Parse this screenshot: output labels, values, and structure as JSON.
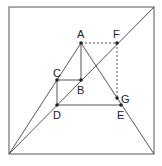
{
  "diagram": {
    "colors": {
      "stroke": "#555555",
      "dashed": "#555555",
      "point": "#222222",
      "label": "#222222",
      "background": "#ffffff"
    },
    "outer_square": {
      "x1": 9,
      "y1": 7,
      "x2": 154,
      "y2": 154
    },
    "points": {
      "A": {
        "label": "A",
        "x": 81,
        "y": 43
      },
      "B": {
        "label": "B",
        "x": 81,
        "y": 80
      },
      "C": {
        "label": "C",
        "x": 57,
        "y": 80
      },
      "D": {
        "label": "D",
        "x": 57,
        "y": 105
      },
      "E": {
        "label": "E",
        "x": 121,
        "y": 105
      },
      "F": {
        "label": "F",
        "x": 117,
        "y": 43
      },
      "G": {
        "label": "G",
        "x": 117,
        "y": 98
      }
    },
    "segments": [
      {
        "name": "diagonal",
        "from": "bottom-left",
        "to": "top-right",
        "style": "solid"
      },
      {
        "name": "left-side-to-A",
        "from": "bottom-left",
        "to": "A",
        "style": "solid"
      },
      {
        "name": "A-to-bottom-right",
        "from": "A",
        "to": "bottom-right",
        "style": "solid"
      },
      {
        "name": "AB",
        "from": "A",
        "to": "B",
        "style": "solid"
      },
      {
        "name": "CB",
        "from": "C",
        "to": "B",
        "style": "solid"
      },
      {
        "name": "CD",
        "from": "C",
        "to": "D",
        "style": "solid"
      },
      {
        "name": "DE",
        "from": "D",
        "to": "E",
        "style": "solid"
      },
      {
        "name": "AF",
        "from": "A",
        "to": "F",
        "style": "dashed"
      },
      {
        "name": "FG",
        "from": "F",
        "to": "G",
        "style": "dashed"
      }
    ]
  }
}
